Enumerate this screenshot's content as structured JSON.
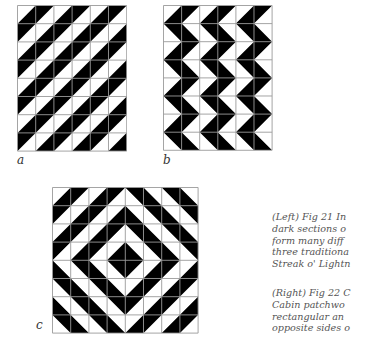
{
  "figures": [
    {
      "id": "a",
      "label": "a",
      "description": "Diagonal stripes of half-square triangles",
      "origin": [
        17,
        5
      ],
      "cell": 18.2,
      "cols": 6,
      "rows": 8,
      "pattern": "diagonal"
    },
    {
      "id": "b",
      "label": "b",
      "description": "Zigzag (Streak o' Lightning) columns",
      "origin": [
        163,
        5
      ],
      "cell": 18.1,
      "cols": 6,
      "rows": 8,
      "pattern": "zigzag"
    },
    {
      "id": "c",
      "label": "c",
      "description": "Concentric diamonds",
      "origin": [
        52,
        187
      ],
      "cell": 18.2,
      "cols": 8,
      "rows": 8,
      "pattern": "diamond"
    }
  ],
  "labels": {
    "a": "a",
    "b": "b",
    "c": "c"
  },
  "captions": {
    "left": [
      "(Left) Fig 21 In",
      "dark sections o",
      "form many diff",
      "three traditiona",
      "Streak o' Lightn"
    ],
    "right": [
      "(Right) Fig 22 C",
      "Cabin patchwo",
      "rectangular an",
      "opposite sides o"
    ]
  },
  "colors": {
    "dark": "#000000",
    "light": "#ffffff",
    "grid": "#9a9a9a",
    "text": "#555555"
  }
}
